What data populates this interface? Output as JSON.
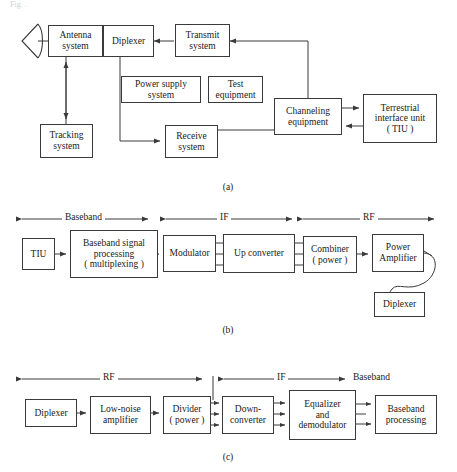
{
  "page": {
    "top_partial_text": "Fig.  .",
    "background": "#ffffff",
    "line_color": "#3a3a3a"
  },
  "captions": {
    "a": "(a)",
    "b": "(b)",
    "c": "(c)"
  },
  "diagram_a": {
    "name": "earth-station-block-diagram",
    "blocks": [
      {
        "id": "antenna",
        "label": "Antenna\nsystem"
      },
      {
        "id": "diplexer",
        "label": "Diplexer"
      },
      {
        "id": "transmit",
        "label": "Transmit\nsystem"
      },
      {
        "id": "power",
        "label": "Power supply\nsystem"
      },
      {
        "id": "test",
        "label": "Test\nequipment"
      },
      {
        "id": "channeling",
        "label": "Channeling\nequipment"
      },
      {
        "id": "tiu",
        "label": "Terrestrial\ninterface unit\n( TIU )"
      },
      {
        "id": "tracking",
        "label": "Tracking\nsystem"
      },
      {
        "id": "receive",
        "label": "Receive\nsystem"
      }
    ]
  },
  "diagram_b": {
    "name": "transmit-chain-block-diagram",
    "sections": [
      {
        "id": "baseband",
        "label": "Baseband"
      },
      {
        "id": "if",
        "label": "IF"
      },
      {
        "id": "rf",
        "label": "RF"
      }
    ],
    "blocks": [
      {
        "id": "tiu",
        "label": "TIU"
      },
      {
        "id": "bbproc",
        "label": "Baseband signal\nprocessing\n( multiplexing )"
      },
      {
        "id": "modulator",
        "label": "Modulator"
      },
      {
        "id": "upconv",
        "label": "Up converter"
      },
      {
        "id": "combiner",
        "label": "Combiner\n( power )"
      },
      {
        "id": "pa",
        "label": "Power\nAmplifier"
      },
      {
        "id": "diplexer",
        "label": "Diplexer"
      }
    ]
  },
  "diagram_c": {
    "name": "receive-chain-block-diagram",
    "sections": [
      {
        "id": "rf",
        "label": "RF"
      },
      {
        "id": "if",
        "label": "IF"
      },
      {
        "id": "baseband",
        "label": "Baseband"
      }
    ],
    "blocks": [
      {
        "id": "diplexer",
        "label": "Diplexer"
      },
      {
        "id": "lna",
        "label": "Low-noise\namplifier"
      },
      {
        "id": "divider",
        "label": "Divider\n( power )"
      },
      {
        "id": "downconv",
        "label": "Down-\nconverter"
      },
      {
        "id": "eqdemod",
        "label": "Equalizer\nand\ndemodulator"
      },
      {
        "id": "bbproc",
        "label": "Baseband\nprocessing"
      }
    ]
  }
}
